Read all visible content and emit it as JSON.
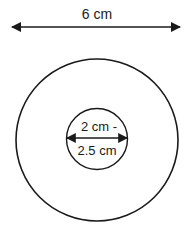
{
  "diagram": {
    "outer_dimension": {
      "label": "6 cm",
      "description": "outer circle diameter"
    },
    "inner_dimension": {
      "label_line1": "2 cm -",
      "label_line2": "2.5 cm",
      "description": "inner circle diameter"
    },
    "colors": {
      "stroke": "#1a1a1a",
      "background": "#ffffff"
    }
  }
}
